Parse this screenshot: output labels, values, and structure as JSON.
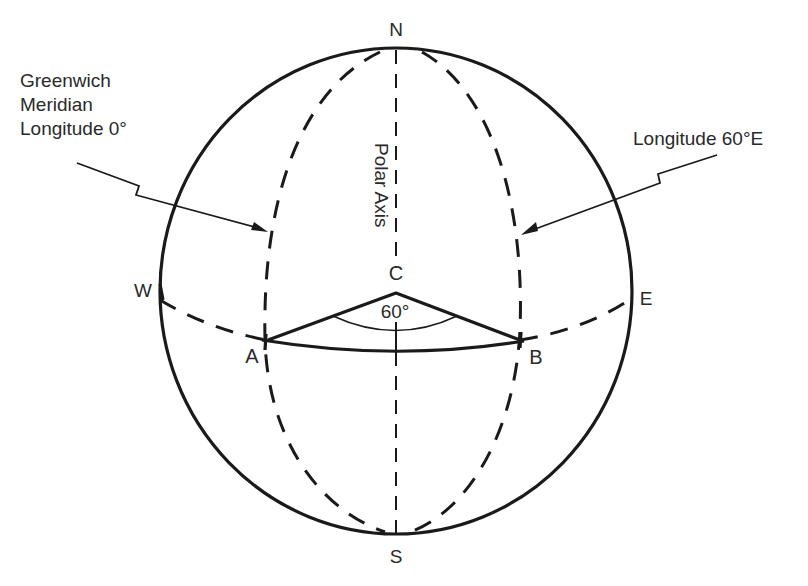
{
  "diagram": {
    "labels": {
      "north": "N",
      "south": "S",
      "west": "W",
      "east": "E",
      "center": "C",
      "point_a": "A",
      "point_b": "B",
      "angle": "60°",
      "polar_axis": "Polar Axis"
    },
    "callouts": {
      "greenwich": {
        "lines": [
          "Greenwich",
          "Meridian",
          "Longitude 0°"
        ]
      },
      "longitude_60e": {
        "text": "Longitude 60°E"
      }
    },
    "geometry": {
      "central_angle_deg": 60,
      "meridians": [
        "Longitude 0°",
        "Longitude 60°E"
      ],
      "stroke_color": "#1a1a1a",
      "background": "#ffffff"
    }
  }
}
